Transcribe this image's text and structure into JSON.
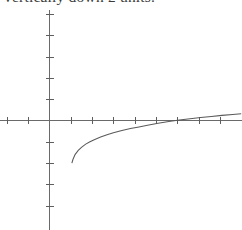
{
  "caption": {
    "text": "vertically down 2 units.",
    "clipped": true
  },
  "figure": {
    "name": "logarithmic-function-graph",
    "background_color": "#ffffff",
    "axis_color": "#6a6a6a",
    "curve_color": "#5a5a5a"
  },
  "chart_data": {
    "type": "line",
    "title": "",
    "subtitle": "",
    "xlabel": "",
    "ylabel": "",
    "grid": false,
    "legend": null,
    "annotations": [],
    "axis_style": "cartesian-cross",
    "origin_px": [
      49,
      120
    ],
    "unit_px": 21.3,
    "xlim": [
      -2.3,
      9.1
    ],
    "ylim": [
      -5.2,
      5.2
    ],
    "xticks": [
      -2,
      -1,
      1,
      2,
      3,
      4,
      5,
      6,
      7,
      8
    ],
    "yticks": [
      -4,
      -3,
      -2,
      -1,
      1,
      2,
      3,
      4,
      5
    ],
    "tick_labels_shown": false,
    "series": [
      {
        "name": "y = log(x - 1) - 2",
        "asymptote_x": 1.0,
        "x_intercept": 5.1,
        "x": [
          1.05,
          1.1,
          1.2,
          1.35,
          1.5,
          1.7,
          1.9,
          2.1,
          2.4,
          2.7,
          3.0,
          3.4,
          3.8,
          4.2,
          4.6,
          5.1,
          5.6,
          6.1,
          6.6,
          7.1,
          7.6,
          8.1,
          8.6,
          9.0
        ],
        "y": [
          -2.0,
          -1.83,
          -1.6,
          -1.4,
          -1.26,
          -1.11,
          -1.0,
          -0.9,
          -0.78,
          -0.67,
          -0.58,
          -0.47,
          -0.38,
          -0.3,
          -0.22,
          -0.13,
          -0.05,
          0.02,
          0.08,
          0.14,
          0.19,
          0.24,
          0.28,
          0.32
        ]
      }
    ]
  }
}
